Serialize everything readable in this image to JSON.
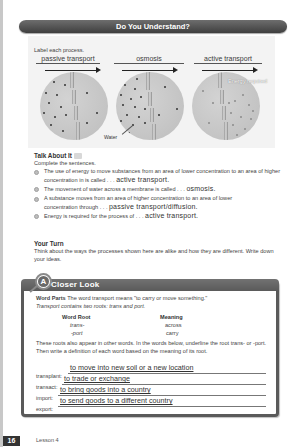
{
  "header": {
    "title": "Do You Understand?"
  },
  "diagram": {
    "instruction": "Label each process.",
    "labels": [
      "passive transport",
      "osmosis",
      "active transport"
    ],
    "captions": {
      "water": "Water",
      "energy": "Energy required"
    }
  },
  "talk_about_it": {
    "title": "Talk About It",
    "icon": "speech-icon",
    "prompt": "Complete the sentences.",
    "items": [
      {
        "text": "The use of energy to move substances from an area of lower concentration to an area of higher concentration in is called . . .",
        "answer": "active transport."
      },
      {
        "text": "The movement of water across a membrane is called . . .",
        "answer": "osmosis."
      },
      {
        "text": "A substance moves from an area of higher concentration to an area of lower concentration through . . .",
        "answer": "passive transport/diffusion."
      },
      {
        "text": "Energy is required for the process of . . .",
        "answer": "active transport."
      }
    ]
  },
  "your_turn": {
    "title": "Your Turn",
    "text": "Think about the ways the processes shown here are alike and how they are different. Write down your ideas."
  },
  "closer_look": {
    "badge": "A",
    "title": "Closer Look",
    "word_parts_label": "Word Parts",
    "intro_1": "The word transport means \"to carry or move something.\"",
    "intro_2": "Transport contains two roots: trans and port.",
    "table": {
      "headers": [
        "Word Root",
        "Meaning"
      ],
      "rows": [
        [
          "trans-",
          "across"
        ],
        [
          "-port",
          "carry"
        ]
      ]
    },
    "instructions": "These roots also appear in other words. In the words below, underline the root trans- or -port. Then write a definition of each word based on the meaning of its root.",
    "definitions": [
      {
        "term": "transplant:",
        "answer": "to move into new soil or a new location"
      },
      {
        "term": "transact:",
        "answer": "to trade or exchange"
      },
      {
        "term": "import:",
        "answer": "to bring goods into a country"
      },
      {
        "term": "export:",
        "answer": "to send goods to a different country"
      }
    ]
  },
  "footer": {
    "page_number": "16",
    "lesson": "Lesson 4"
  }
}
